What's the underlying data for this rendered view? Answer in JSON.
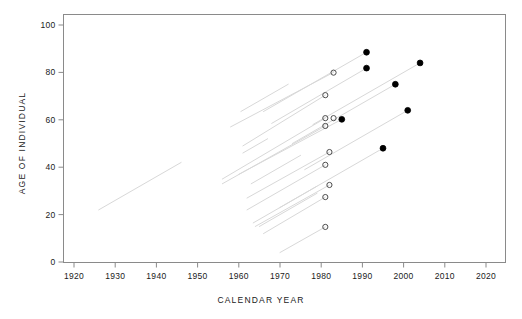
{
  "chart_data": {
    "type": "scatter",
    "title": "",
    "xlabel": "CALENDAR YEAR",
    "ylabel": "AGE OF INDIVIDUAL",
    "xlim": [
      1916,
      2024
    ],
    "ylim": [
      -3,
      104
    ],
    "xticks": [
      1920,
      1930,
      1940,
      1950,
      1960,
      1970,
      1980,
      1990,
      2000,
      2010,
      2020
    ],
    "yticks": [
      0,
      20,
      40,
      60,
      80,
      100
    ],
    "grid": false,
    "legend": "none",
    "series": [
      {
        "name": "deaths",
        "marker": "filled-circle",
        "color": "#000000",
        "points": [
          {
            "x": 1991.0,
            "y": 88.5
          },
          {
            "x": 1991.0,
            "y": 81.8
          },
          {
            "x": 2004.0,
            "y": 84.0
          },
          {
            "x": 1998.0,
            "y": 75.0
          },
          {
            "x": 2001.0,
            "y": 64.0
          },
          {
            "x": 1985.0,
            "y": 60.2
          },
          {
            "x": 1995.0,
            "y": 48.0
          }
        ]
      },
      {
        "name": "censored",
        "marker": "open-circle",
        "color": "#4d4d4d",
        "points": [
          {
            "x": 1983.0,
            "y": 79.9
          },
          {
            "x": 1981.0,
            "y": 70.4
          },
          {
            "x": 1981.0,
            "y": 60.7
          },
          {
            "x": 1983.0,
            "y": 60.7
          },
          {
            "x": 1981.0,
            "y": 57.4
          },
          {
            "x": 1982.0,
            "y": 46.4
          },
          {
            "x": 1981.0,
            "y": 41.0
          },
          {
            "x": 1982.0,
            "y": 32.5
          },
          {
            "x": 1981.0,
            "y": 27.4
          },
          {
            "x": 1981.0,
            "y": 14.8
          }
        ]
      }
    ],
    "lifelines": [
      {
        "x0": 1926.0,
        "y0": 22.0,
        "x1": 1946.0,
        "y1": 42.0
      },
      {
        "x0": 1961.0,
        "y0": 46.0,
        "x1": 1967.0,
        "y1": 52.0
      },
      {
        "x0": 1960.5,
        "y0": 63.5,
        "x1": 1972.0,
        "y1": 75.0
      },
      {
        "x0": 1963.0,
        "y0": 33.0,
        "x1": 1975.0,
        "y1": 45.0
      },
      {
        "x0": 1963.5,
        "y0": 16.5,
        "x1": 1979.0,
        "y1": 32.0
      },
      {
        "x0": 1965.0,
        "y0": 15.0,
        "x1": 1979.0,
        "y1": 29.0
      },
      {
        "x0": 1958.0,
        "y0": 57.0,
        "x1": 1983.0,
        "y1": 80.0
      },
      {
        "x0": 1961.0,
        "y0": 49.0,
        "x1": 1981.0,
        "y1": 70.4
      },
      {
        "x0": 1956.0,
        "y0": 35.0,
        "x1": 1981.0,
        "y1": 60.7
      },
      {
        "x0": 1960.0,
        "y0": 37.0,
        "x1": 1985.0,
        "y1": 60.2
      },
      {
        "x0": 1956.0,
        "y0": 33.0,
        "x1": 1981.0,
        "y1": 57.4
      },
      {
        "x0": 1966.0,
        "y0": 63.5,
        "x1": 1991.0,
        "y1": 88.5
      },
      {
        "x0": 1968.0,
        "y0": 58.5,
        "x1": 1991.0,
        "y1": 81.8
      },
      {
        "x0": 1978.0,
        "y0": 58.0,
        "x1": 2004.0,
        "y1": 84.0
      },
      {
        "x0": 1973.0,
        "y0": 50.0,
        "x1": 1998.0,
        "y1": 75.0
      },
      {
        "x0": 1976.0,
        "y0": 39.0,
        "x1": 2001.0,
        "y1": 64.0
      },
      {
        "x0": 1970.0,
        "y0": 23.0,
        "x1": 1995.0,
        "y1": 48.0
      },
      {
        "x0": 1962.0,
        "y0": 27.0,
        "x1": 1982.0,
        "y1": 46.4
      },
      {
        "x0": 1962.0,
        "y0": 22.0,
        "x1": 1981.0,
        "y1": 41.0
      },
      {
        "x0": 1964.0,
        "y0": 15.0,
        "x1": 1982.0,
        "y1": 32.5
      },
      {
        "x0": 1966.0,
        "y0": 12.0,
        "x1": 1981.0,
        "y1": 27.4
      },
      {
        "x0": 1970.0,
        "y0": 4.0,
        "x1": 1981.0,
        "y1": 14.8
      }
    ]
  },
  "axes": {
    "x_title": "CALENDAR YEAR",
    "y_title": "AGE OF INDIVIDUAL",
    "x_tick_labels": [
      "1920",
      "1930",
      "1940",
      "1950",
      "1960",
      "1970",
      "1980",
      "1990",
      "2000",
      "2010",
      "2020"
    ],
    "y_tick_labels": [
      "0",
      "20",
      "40",
      "60",
      "80",
      "100"
    ]
  },
  "colors": {
    "frame": "#8a8a8a",
    "marker_filled": "#000000",
    "marker_open": "#4d4d4d",
    "lifeline": "#d8d8d8",
    "text": "#1a1a1a"
  }
}
